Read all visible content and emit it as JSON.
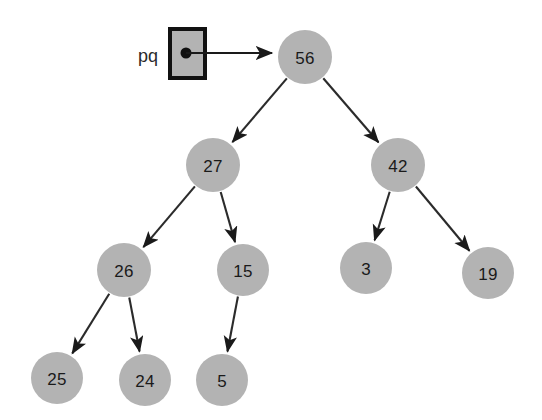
{
  "canvas": {
    "width": 542,
    "height": 420,
    "background": "#ffffff"
  },
  "colors": {
    "node_fill": "#b3b3b3",
    "node_text": "#1a1a1a",
    "edge": "#2b2b2b",
    "box_fill": "#b3b3b3",
    "box_border": "#111111",
    "pointer": "#1a1a1a"
  },
  "pointer": {
    "label": "pq",
    "label_x": 148,
    "label_y": 56,
    "box": {
      "x": 170,
      "y": 29,
      "width": 35,
      "height": 49
    },
    "dot": {
      "cx": 186,
      "cy": 53,
      "r": 5.5
    },
    "line": {
      "x1": 186,
      "y1": 53,
      "x2": 272,
      "y2": 53
    },
    "arrow": "arrowhead"
  },
  "diagram": {
    "type": "binary-heap-tree",
    "node_radius": 27,
    "nodes": [
      {
        "id": "n56",
        "label": "56",
        "cx": 305,
        "cy": 57,
        "r": 27
      },
      {
        "id": "n27",
        "label": "27",
        "cx": 213,
        "cy": 165,
        "r": 27
      },
      {
        "id": "n42",
        "label": "42",
        "cx": 398,
        "cy": 165,
        "r": 27
      },
      {
        "id": "n26",
        "label": "26",
        "cx": 124,
        "cy": 270,
        "r": 27
      },
      {
        "id": "n15",
        "label": "15",
        "cx": 243,
        "cy": 270,
        "r": 26
      },
      {
        "id": "n3",
        "label": "3",
        "cx": 366,
        "cy": 268,
        "r": 26
      },
      {
        "id": "n19",
        "label": "19",
        "cx": 488,
        "cy": 273,
        "r": 26
      },
      {
        "id": "n25",
        "label": "25",
        "cx": 57,
        "cy": 378,
        "r": 26
      },
      {
        "id": "n24",
        "label": "24",
        "cx": 145,
        "cy": 380,
        "r": 26
      },
      {
        "id": "n5",
        "label": "5",
        "cx": 222,
        "cy": 380,
        "r": 26
      }
    ],
    "edges": [
      {
        "from": "n56",
        "to": "n27",
        "arrow": true
      },
      {
        "from": "n56",
        "to": "n42",
        "arrow": true
      },
      {
        "from": "n27",
        "to": "n26",
        "arrow": true
      },
      {
        "from": "n27",
        "to": "n15",
        "arrow": true
      },
      {
        "from": "n42",
        "to": "n3",
        "arrow": true
      },
      {
        "from": "n42",
        "to": "n19",
        "arrow": true
      },
      {
        "from": "n26",
        "to": "n25",
        "arrow": true
      },
      {
        "from": "n26",
        "to": "n24",
        "arrow": true
      },
      {
        "from": "n15",
        "to": "n5",
        "arrow": true
      }
    ]
  }
}
